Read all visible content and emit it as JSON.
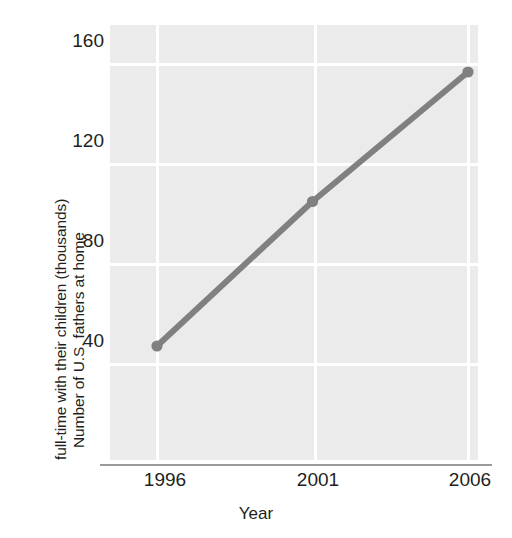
{
  "chart_data": {
    "type": "line",
    "title": "",
    "xlabel": "Year",
    "ylabel": "Number of U.S. fathers at home full-time with their children (thousands)",
    "ylabel_line1": "Number of U.S. fathers at home",
    "ylabel_line2": "full-time with their children (thousands)",
    "x": [
      1996,
      2001,
      2006
    ],
    "values": [
      40,
      98,
      150
    ],
    "xticks": [
      "1996",
      "2001",
      "2006"
    ],
    "yticks": [
      "160",
      "120",
      "80",
      "40"
    ],
    "ytick_values": [
      160,
      120,
      80,
      40
    ],
    "ylim": [
      0,
      178
    ],
    "xlim": [
      1994.4,
      2007.6
    ],
    "grid": true,
    "legend": "none",
    "series_color": "#808080",
    "plot_background": "#ebebeb",
    "gridline_color": "#ffffff",
    "marker": "circle",
    "line_width": 6
  },
  "axis": {
    "y_tick_160": "160",
    "y_tick_120": "120",
    "y_tick_80": "80",
    "y_tick_40": "40",
    "x_tick_1996": "1996",
    "x_tick_2001": "2001",
    "x_tick_2006": "2006",
    "x_title": "Year",
    "y_title_line1": "Number of U.S. fathers at home",
    "y_title_line2": "full-time with their children (thousands)"
  }
}
